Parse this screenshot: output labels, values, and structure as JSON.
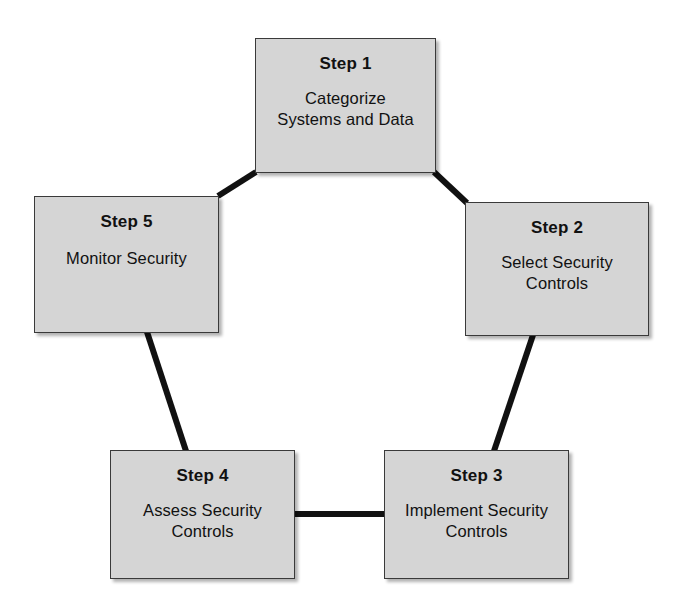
{
  "diagram": {
    "type": "cycle",
    "shape": "pentagon",
    "step_count": 5,
    "box_fill_color": "#d5d5d5",
    "box_border_color": "#3a3a3a",
    "connector_color": "#111111",
    "background_color": "#ffffff",
    "steps": [
      {
        "id": "step-1",
        "title": "Step 1",
        "description": "Categorize\nSystems and Data"
      },
      {
        "id": "step-2",
        "title": "Step 2",
        "description": "Select Security\nControls"
      },
      {
        "id": "step-3",
        "title": "Step 3",
        "description": "Implement Security\nControls"
      },
      {
        "id": "step-4",
        "title": "Step 4",
        "description": "Assess Security\nControls"
      },
      {
        "id": "step-5",
        "title": "Step 5",
        "description": "Monitor Security"
      }
    ],
    "connectors": [
      {
        "id": "connector-5-to-1",
        "from": "step-5",
        "to": "step-1"
      },
      {
        "id": "connector-1-to-2",
        "from": "step-1",
        "to": "step-2"
      },
      {
        "id": "connector-2-to-3",
        "from": "step-2",
        "to": "step-3"
      },
      {
        "id": "connector-3-to-4",
        "from": "step-3",
        "to": "step-4"
      },
      {
        "id": "connector-4-to-5",
        "from": "step-4",
        "to": "step-5"
      }
    ]
  }
}
